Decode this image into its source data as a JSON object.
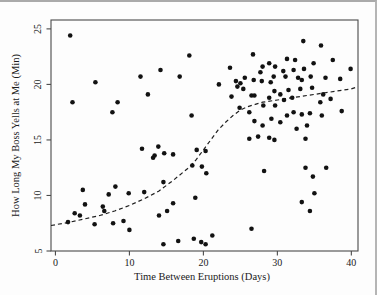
{
  "chart_data": {
    "type": "scatter",
    "title": "",
    "xlabel": "Time Between Eruptions (Days)",
    "ylabel": "How Long My Boss Yells at Me (Min)",
    "xlim": [
      -0.6,
      40.9
    ],
    "ylim": [
      5.0,
      25.8
    ],
    "xticks": [
      0,
      10,
      20,
      30,
      40
    ],
    "yticks": [
      5,
      10,
      15,
      20,
      25
    ],
    "grid": false,
    "legend": "none",
    "marker": "filled-circle",
    "marker_color": "#121212",
    "frame_color": "#4a4a4a",
    "points": [
      [
        1.7,
        7.6
      ],
      [
        2.6,
        8.4
      ],
      [
        3.3,
        8.2
      ],
      [
        5.3,
        7.4
      ],
      [
        7.8,
        7.5
      ],
      [
        9.2,
        7.7
      ],
      [
        10.0,
        6.9
      ],
      [
        3.7,
        10.5
      ],
      [
        4.0,
        9.2
      ],
      [
        6.4,
        9.0
      ],
      [
        6.6,
        8.6
      ],
      [
        7.2,
        10.1
      ],
      [
        8.1,
        10.8
      ],
      [
        9.9,
        10.2
      ],
      [
        12.0,
        10.3
      ],
      [
        11.7,
        14.2
      ],
      [
        2.0,
        24.4
      ],
      [
        2.3,
        18.4
      ],
      [
        5.4,
        20.2
      ],
      [
        7.7,
        17.5
      ],
      [
        8.4,
        18.4
      ],
      [
        11.5,
        20.7
      ],
      [
        12.5,
        19.1
      ],
      [
        13.2,
        13.4
      ],
      [
        13.4,
        13.6
      ],
      [
        13.9,
        14.4
      ],
      [
        14.7,
        13.8
      ],
      [
        15.9,
        13.7
      ],
      [
        14.6,
        11.2
      ],
      [
        14.0,
        8.2
      ],
      [
        15.1,
        8.6
      ],
      [
        15.9,
        9.3
      ],
      [
        18.9,
        9.8
      ],
      [
        14.6,
        5.6
      ],
      [
        16.6,
        5.9
      ],
      [
        18.7,
        6.1
      ],
      [
        19.7,
        5.8
      ],
      [
        20.3,
        5.6
      ],
      [
        21.2,
        6.4
      ],
      [
        14.2,
        21.3
      ],
      [
        16.8,
        20.7
      ],
      [
        18.1,
        22.6
      ],
      [
        18.4,
        17.2
      ],
      [
        18.5,
        12.7
      ],
      [
        19.1,
        14.1
      ],
      [
        19.8,
        12.6
      ],
      [
        20.3,
        14.0
      ],
      [
        20.4,
        12.0
      ],
      [
        26.5,
        7.0
      ],
      [
        26.2,
        15.1
      ],
      [
        27.4,
        15.3
      ],
      [
        28.9,
        15.2
      ],
      [
        29.6,
        15.0
      ],
      [
        33.8,
        15.1
      ],
      [
        28.2,
        12.2
      ],
      [
        33.8,
        12.5
      ],
      [
        34.8,
        11.7
      ],
      [
        36.6,
        12.5
      ],
      [
        35.0,
        10.2
      ],
      [
        33.3,
        9.4
      ],
      [
        34.4,
        8.6
      ],
      [
        28.0,
        16.3
      ],
      [
        29.2,
        16.9
      ],
      [
        30.4,
        16.6
      ],
      [
        32.6,
        16.0
      ],
      [
        34.0,
        16.3
      ],
      [
        26.9,
        16.7
      ],
      [
        26.2,
        17.5
      ],
      [
        24.9,
        17.9
      ],
      [
        28.1,
        18.1
      ],
      [
        29.7,
        18.1
      ],
      [
        31.3,
        17.2
      ],
      [
        32.2,
        17.5
      ],
      [
        33.3,
        17.3
      ],
      [
        34.4,
        17.4
      ],
      [
        36.0,
        17.2
      ],
      [
        38.7,
        17.6
      ],
      [
        23.8,
        18.9
      ],
      [
        26.5,
        19.0
      ],
      [
        26.9,
        19.0
      ],
      [
        28.9,
        18.8
      ],
      [
        29.6,
        19.4
      ],
      [
        30.4,
        19.1
      ],
      [
        30.9,
        18.6
      ],
      [
        31.5,
        19.5
      ],
      [
        32.0,
        18.8
      ],
      [
        33.1,
        19.6
      ],
      [
        34.7,
        19.7
      ],
      [
        35.8,
        18.4
      ],
      [
        36.2,
        19.1
      ],
      [
        37.2,
        18.7
      ],
      [
        22.1,
        20.0
      ],
      [
        23.6,
        21.5
      ],
      [
        24.4,
        20.3
      ],
      [
        24.6,
        19.8
      ],
      [
        25.0,
        20.1
      ],
      [
        25.4,
        19.6
      ],
      [
        25.6,
        20.6
      ],
      [
        26.8,
        20.4
      ],
      [
        26.7,
        22.7
      ],
      [
        27.7,
        21.1
      ],
      [
        27.9,
        20.3
      ],
      [
        28.0,
        21.6
      ],
      [
        28.9,
        21.9
      ],
      [
        29.1,
        20.2
      ],
      [
        29.5,
        20.7
      ],
      [
        29.7,
        21.6
      ],
      [
        30.8,
        21.2
      ],
      [
        31.1,
        20.7
      ],
      [
        31.3,
        22.3
      ],
      [
        32.4,
        22.2
      ],
      [
        32.2,
        21.3
      ],
      [
        32.8,
        20.6
      ],
      [
        33.3,
        20.4
      ],
      [
        33.6,
        21.4
      ],
      [
        34.9,
        21.9
      ],
      [
        34.5,
        20.7
      ],
      [
        33.5,
        23.9
      ],
      [
        35.9,
        23.5
      ],
      [
        37.5,
        22.2
      ],
      [
        36.5,
        20.6
      ],
      [
        38.5,
        20.5
      ],
      [
        39.9,
        21.4
      ]
    ],
    "trend_line": {
      "kind": "lowess-smooth",
      "style": "dashed",
      "color": "#1f1f1f",
      "points": [
        [
          -0.6,
          7.3
        ],
        [
          2,
          7.6
        ],
        [
          4,
          7.9
        ],
        [
          6,
          8.2
        ],
        [
          8,
          8.6
        ],
        [
          10,
          9.1
        ],
        [
          12,
          9.7
        ],
        [
          14,
          10.4
        ],
        [
          16,
          11.4
        ],
        [
          18,
          12.5
        ],
        [
          19,
          13.2
        ],
        [
          20,
          14.1
        ],
        [
          21,
          15.0
        ],
        [
          22,
          15.9
        ],
        [
          23,
          16.6
        ],
        [
          24,
          17.2
        ],
        [
          25,
          17.7
        ],
        [
          26,
          18.0
        ],
        [
          27,
          18.2
        ],
        [
          28,
          18.4
        ],
        [
          30,
          18.6
        ],
        [
          32,
          18.8
        ],
        [
          34,
          19.0
        ],
        [
          36,
          19.2
        ],
        [
          38,
          19.4
        ],
        [
          40,
          19.6
        ],
        [
          40.9,
          19.8
        ]
      ]
    }
  }
}
